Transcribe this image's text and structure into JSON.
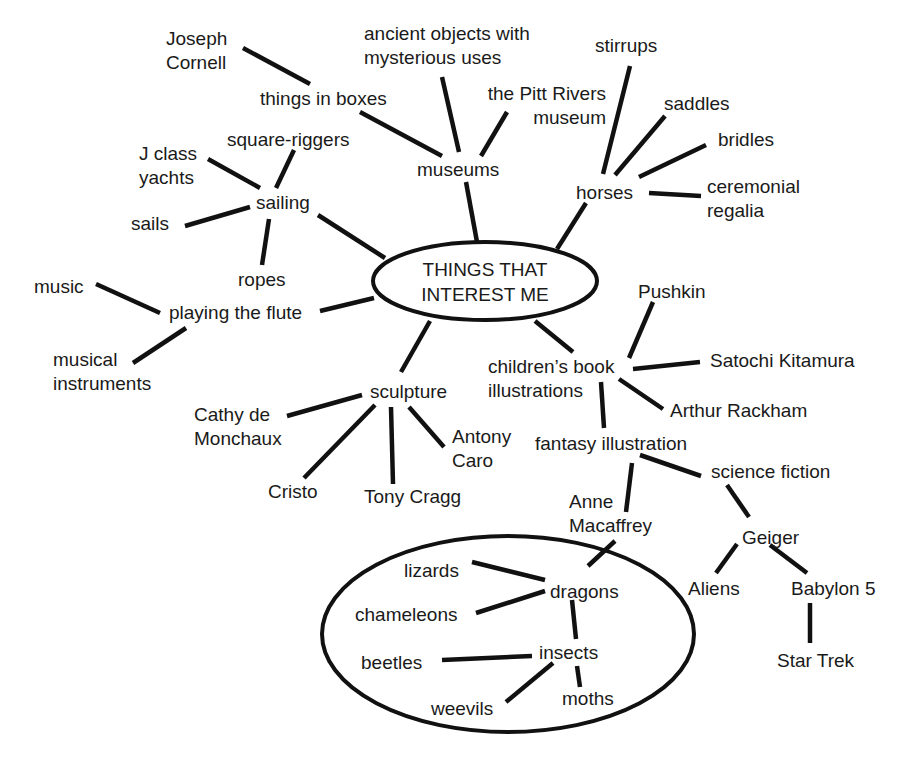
{
  "diagram": {
    "type": "mind-map",
    "stroke_color": "#111111",
    "text_color": "#1a1a1a",
    "background": "#ffffff",
    "center": {
      "id": "center",
      "lines": [
        "THINGS THAT",
        "INTEREST ME"
      ],
      "x": 388,
      "y": 257,
      "align": "center",
      "width": 194
    },
    "ellipses": [
      {
        "name": "center-ellipse",
        "cx": 485,
        "cy": 281,
        "rx": 112,
        "ry": 39
      },
      {
        "name": "dragons-group-ellipse",
        "cx": 508,
        "cy": 634,
        "rx": 186,
        "ry": 98
      }
    ],
    "nodes": [
      {
        "id": "joseph-cornell",
        "lines": [
          "Joseph",
          "Cornell"
        ],
        "x": 166,
        "y": 27
      },
      {
        "id": "things-in-boxes",
        "lines": [
          "things in boxes"
        ],
        "x": 260,
        "y": 87
      },
      {
        "id": "ancient-objects",
        "lines": [
          "ancient objects with",
          "mysterious uses"
        ],
        "x": 364,
        "y": 22
      },
      {
        "id": "pitt-rivers",
        "lines": [
          "the Pitt Rivers",
          "museum"
        ],
        "x": 468,
        "y": 82,
        "align": "right",
        "width": 138
      },
      {
        "id": "museums",
        "lines": [
          "museums"
        ],
        "x": 417,
        "y": 158
      },
      {
        "id": "stirrups",
        "lines": [
          "stirrups"
        ],
        "x": 595,
        "y": 34
      },
      {
        "id": "saddles",
        "lines": [
          "saddles"
        ],
        "x": 664,
        "y": 92
      },
      {
        "id": "bridles",
        "lines": [
          "bridles"
        ],
        "x": 718,
        "y": 128
      },
      {
        "id": "ceremonial-regalia",
        "lines": [
          "ceremonial",
          "regalia"
        ],
        "x": 707,
        "y": 175
      },
      {
        "id": "horses",
        "lines": [
          "horses"
        ],
        "x": 576,
        "y": 181
      },
      {
        "id": "j-class-yachts",
        "lines": [
          "J class",
          "yachts"
        ],
        "x": 139,
        "y": 142
      },
      {
        "id": "square-riggers",
        "lines": [
          "square-riggers"
        ],
        "x": 227,
        "y": 128
      },
      {
        "id": "sailing",
        "lines": [
          "sailing"
        ],
        "x": 256,
        "y": 191
      },
      {
        "id": "sails",
        "lines": [
          "sails"
        ],
        "x": 131,
        "y": 212
      },
      {
        "id": "ropes",
        "lines": [
          "ropes"
        ],
        "x": 238,
        "y": 268
      },
      {
        "id": "music",
        "lines": [
          "music"
        ],
        "x": 34,
        "y": 275
      },
      {
        "id": "playing-the-flute",
        "lines": [
          "playing the flute"
        ],
        "x": 169,
        "y": 301
      },
      {
        "id": "musical-instruments",
        "lines": [
          "musical",
          "instruments"
        ],
        "x": 53,
        "y": 348
      },
      {
        "id": "pushkin",
        "lines": [
          "Pushkin"
        ],
        "x": 638,
        "y": 280
      },
      {
        "id": "childrens-book-illustrations",
        "lines": [
          "children’s book",
          "illustrations"
        ],
        "x": 488,
        "y": 355
      },
      {
        "id": "satochi-kitamura",
        "lines": [
          "Satochi Kitamura"
        ],
        "x": 710,
        "y": 349
      },
      {
        "id": "arthur-rackham",
        "lines": [
          "Arthur Rackham"
        ],
        "x": 670,
        "y": 399
      },
      {
        "id": "fantasy-illustration",
        "lines": [
          "fantasy illustration"
        ],
        "x": 535,
        "y": 432
      },
      {
        "id": "science-fiction",
        "lines": [
          "science fiction"
        ],
        "x": 711,
        "y": 460
      },
      {
        "id": "sculpture",
        "lines": [
          "sculpture"
        ],
        "x": 370,
        "y": 380
      },
      {
        "id": "cathy-de-monchaux",
        "lines": [
          "Cathy de",
          "Monchaux"
        ],
        "x": 194,
        "y": 403
      },
      {
        "id": "antony-caro",
        "lines": [
          "Antony",
          "Caro"
        ],
        "x": 452,
        "y": 425
      },
      {
        "id": "cristo",
        "lines": [
          "Cristo"
        ],
        "x": 268,
        "y": 480
      },
      {
        "id": "tony-cragg",
        "lines": [
          "Tony Cragg"
        ],
        "x": 364,
        "y": 485
      },
      {
        "id": "anne-macaffrey",
        "lines": [
          "Anne",
          "Macaffrey"
        ],
        "x": 569,
        "y": 490
      },
      {
        "id": "geiger",
        "lines": [
          "Geiger"
        ],
        "x": 742,
        "y": 526
      },
      {
        "id": "aliens",
        "lines": [
          "Aliens"
        ],
        "x": 688,
        "y": 577
      },
      {
        "id": "babylon-5",
        "lines": [
          "Babylon 5"
        ],
        "x": 791,
        "y": 577
      },
      {
        "id": "star-trek",
        "lines": [
          "Star Trek"
        ],
        "x": 777,
        "y": 649
      },
      {
        "id": "lizards",
        "lines": [
          "lizards"
        ],
        "x": 404,
        "y": 559
      },
      {
        "id": "dragons",
        "lines": [
          "dragons"
        ],
        "x": 550,
        "y": 580
      },
      {
        "id": "chameleons",
        "lines": [
          "chameleons"
        ],
        "x": 355,
        "y": 603
      },
      {
        "id": "beetles",
        "lines": [
          "beetles"
        ],
        "x": 361,
        "y": 651
      },
      {
        "id": "insects",
        "lines": [
          "insects"
        ],
        "x": 539,
        "y": 641
      },
      {
        "id": "weevils",
        "lines": [
          "weevils"
        ],
        "x": 431,
        "y": 697
      },
      {
        "id": "moths",
        "lines": [
          "moths"
        ],
        "x": 562,
        "y": 687
      }
    ],
    "edges": [
      {
        "from": "joseph-cornell",
        "to": "things-in-boxes",
        "x1": 243,
        "y1": 48,
        "x2": 310,
        "y2": 84
      },
      {
        "from": "things-in-boxes",
        "to": "museums",
        "x1": 360,
        "y1": 112,
        "x2": 442,
        "y2": 156
      },
      {
        "from": "ancient-objects",
        "to": "museums",
        "x1": 442,
        "y1": 77,
        "x2": 459,
        "y2": 152
      },
      {
        "from": "pitt-rivers",
        "to": "museums",
        "x1": 507,
        "y1": 112,
        "x2": 481,
        "y2": 156
      },
      {
        "from": "museums",
        "to": "center",
        "x1": 466,
        "y1": 182,
        "x2": 477,
        "y2": 242
      },
      {
        "from": "stirrups",
        "to": "horses",
        "x1": 630,
        "y1": 66,
        "x2": 603,
        "y2": 174
      },
      {
        "from": "saddles",
        "to": "horses",
        "x1": 665,
        "y1": 116,
        "x2": 615,
        "y2": 175
      },
      {
        "from": "bridles",
        "to": "horses",
        "x1": 706,
        "y1": 145,
        "x2": 639,
        "y2": 177
      },
      {
        "from": "ceremonial-regalia",
        "to": "horses",
        "x1": 701,
        "y1": 196,
        "x2": 649,
        "y2": 193
      },
      {
        "from": "horses",
        "to": "center",
        "x1": 586,
        "y1": 203,
        "x2": 557,
        "y2": 249
      },
      {
        "from": "j-class-yachts",
        "to": "sailing",
        "x1": 208,
        "y1": 159,
        "x2": 260,
        "y2": 188
      },
      {
        "from": "square-riggers",
        "to": "sailing",
        "x1": 294,
        "y1": 150,
        "x2": 276,
        "y2": 188
      },
      {
        "from": "sails",
        "to": "sailing",
        "x1": 185,
        "y1": 226,
        "x2": 250,
        "y2": 207
      },
      {
        "from": "sailing",
        "to": "ropes",
        "x1": 269,
        "y1": 219,
        "x2": 262,
        "y2": 265
      },
      {
        "from": "sailing",
        "to": "center",
        "x1": 318,
        "y1": 215,
        "x2": 385,
        "y2": 258
      },
      {
        "from": "music",
        "to": "playing-the-flute",
        "x1": 96,
        "y1": 284,
        "x2": 160,
        "y2": 313
      },
      {
        "from": "musical-instruments",
        "to": "playing-the-flute",
        "x1": 133,
        "y1": 363,
        "x2": 186,
        "y2": 328
      },
      {
        "from": "playing-the-flute",
        "to": "center",
        "x1": 320,
        "y1": 311,
        "x2": 374,
        "y2": 298
      },
      {
        "from": "center",
        "to": "sculpture",
        "x1": 430,
        "y1": 321,
        "x2": 401,
        "y2": 372
      },
      {
        "from": "sculpture",
        "to": "cathy-de-monchaux",
        "x1": 362,
        "y1": 395,
        "x2": 287,
        "y2": 416
      },
      {
        "from": "sculpture",
        "to": "cristo",
        "x1": 375,
        "y1": 405,
        "x2": 304,
        "y2": 478
      },
      {
        "from": "sculpture",
        "to": "tony-cragg",
        "x1": 391,
        "y1": 407,
        "x2": 393,
        "y2": 484
      },
      {
        "from": "sculpture",
        "to": "antony-caro",
        "x1": 409,
        "y1": 407,
        "x2": 444,
        "y2": 447
      },
      {
        "from": "center",
        "to": "childrens-book-illustrations",
        "x1": 535,
        "y1": 321,
        "x2": 573,
        "y2": 352
      },
      {
        "from": "pushkin",
        "to": "childrens-book-illustrations",
        "x1": 653,
        "y1": 302,
        "x2": 629,
        "y2": 358
      },
      {
        "from": "childrens-book-illustrations",
        "to": "satochi-kitamura",
        "x1": 633,
        "y1": 369,
        "x2": 700,
        "y2": 362
      },
      {
        "from": "childrens-book-illustrations",
        "to": "arthur-rackham",
        "x1": 619,
        "y1": 379,
        "x2": 663,
        "y2": 409
      },
      {
        "from": "childrens-book-illustrations",
        "to": "fantasy-illustration",
        "x1": 601,
        "y1": 382,
        "x2": 604,
        "y2": 428
      },
      {
        "from": "fantasy-illustration",
        "to": "science-fiction",
        "x1": 640,
        "y1": 455,
        "x2": 701,
        "y2": 476
      },
      {
        "from": "fantasy-illustration",
        "to": "anne-macaffrey",
        "x1": 632,
        "y1": 463,
        "x2": 626,
        "y2": 512
      },
      {
        "from": "anne-macaffrey",
        "to": "dragons",
        "x1": 615,
        "y1": 541,
        "x2": 588,
        "y2": 566
      },
      {
        "from": "science-fiction",
        "to": "geiger",
        "x1": 727,
        "y1": 485,
        "x2": 749,
        "y2": 517
      },
      {
        "from": "geiger",
        "to": "aliens",
        "x1": 737,
        "y1": 544,
        "x2": 716,
        "y2": 573
      },
      {
        "from": "geiger",
        "to": "babylon-5",
        "x1": 770,
        "y1": 545,
        "x2": 807,
        "y2": 573
      },
      {
        "from": "babylon-5",
        "to": "star-trek",
        "x1": 810,
        "y1": 603,
        "x2": 810,
        "y2": 643
      },
      {
        "from": "lizards",
        "to": "dragons",
        "x1": 472,
        "y1": 562,
        "x2": 545,
        "y2": 580
      },
      {
        "from": "chameleons",
        "to": "dragons",
        "x1": 476,
        "y1": 613,
        "x2": 545,
        "y2": 591
      },
      {
        "from": "dragons",
        "to": "insects",
        "x1": 572,
        "y1": 600,
        "x2": 576,
        "y2": 639
      },
      {
        "from": "beetles",
        "to": "insects",
        "x1": 442,
        "y1": 660,
        "x2": 532,
        "y2": 656
      },
      {
        "from": "insects",
        "to": "weevils",
        "x1": 553,
        "y1": 663,
        "x2": 506,
        "y2": 702
      },
      {
        "from": "insects",
        "to": "moths",
        "x1": 577,
        "y1": 666,
        "x2": 580,
        "y2": 687
      }
    ]
  }
}
